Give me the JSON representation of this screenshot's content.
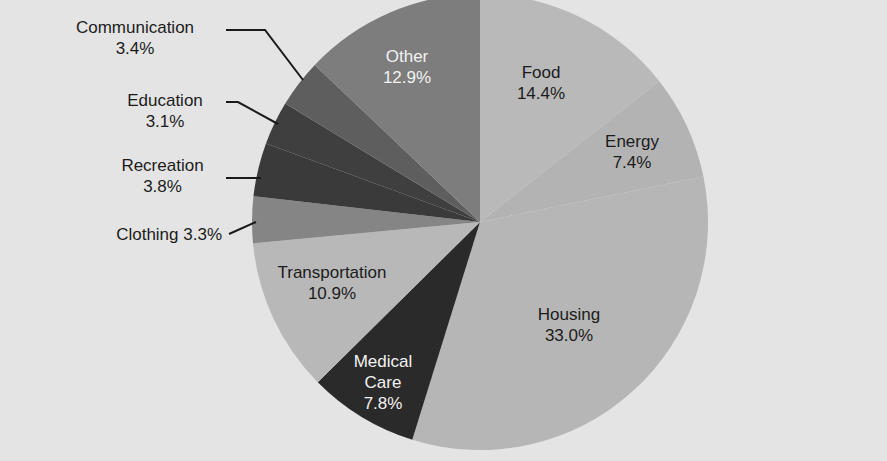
{
  "chart_data": {
    "type": "pie",
    "title": "",
    "start_angle_deg": 0,
    "direction": "clockwise",
    "slices": [
      {
        "label": "Food",
        "value": 14.4,
        "display": "14.4%",
        "color": "#b9b9b9"
      },
      {
        "label": "Energy",
        "value": 7.4,
        "display": "7.4%",
        "color": "#b3b3b3"
      },
      {
        "label": "Housing",
        "value": 33.0,
        "display": "33.0%",
        "color": "#b6b6b6"
      },
      {
        "label": "Medical Care",
        "value": 7.8,
        "display": "7.8%",
        "color": "#2a2a2a"
      },
      {
        "label": "Transportation",
        "value": 10.9,
        "display": "10.9%",
        "color": "#b8b8b8"
      },
      {
        "label": "Clothing",
        "value": 3.3,
        "display": "3.3%",
        "color": "#858585"
      },
      {
        "label": "Recreation",
        "value": 3.8,
        "display": "3.8%",
        "color": "#3a3a3a"
      },
      {
        "label": "Education",
        "value": 3.1,
        "display": "3.1%",
        "color": "#3f3f3f"
      },
      {
        "label": "Communication",
        "value": 3.4,
        "display": "3.4%",
        "color": "#5e5e5e"
      },
      {
        "label": "Other",
        "value": 12.9,
        "display": "12.9%",
        "color": "#7d7d7d"
      }
    ],
    "legend": "none (direct labels)",
    "center": [
      480,
      222
    ],
    "radius": 228
  },
  "labels": {
    "food": {
      "name": "Food",
      "value": "14.4%"
    },
    "energy": {
      "name": "Energy",
      "value": "7.4%"
    },
    "housing": {
      "name": "Housing",
      "value": "33.0%"
    },
    "medical": {
      "name1": "Medical",
      "name2": "Care",
      "value": "7.8%"
    },
    "transportation": {
      "name": "Transportation",
      "value": "10.9%"
    },
    "clothing": {
      "text": "Clothing 3.3%"
    },
    "recreation": {
      "name": "Recreation",
      "value": "3.8%"
    },
    "education": {
      "name": "Education",
      "value": "3.1%"
    },
    "communication": {
      "name": "Communication",
      "value": "3.4%"
    },
    "other": {
      "name": "Other",
      "value": "12.9%"
    }
  },
  "background_color": "#e4e4e4"
}
